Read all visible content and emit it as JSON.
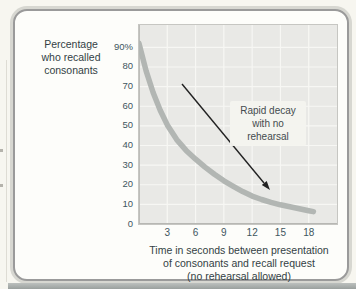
{
  "colors": {
    "page_bg": "#f7f6f0",
    "panel_bg": "#fdfdfa",
    "panel_border": "#9a9a9a",
    "plot_bg": "#e9e9e6",
    "grid_line": "#f7f7f4",
    "curve": "#b2b6b3",
    "arrow": "#222222",
    "text": "#333f44",
    "tick_text": "#3e565e",
    "annotation_bg": "#f5f5f0"
  },
  "labels": {
    "y_axis_lines": [
      "Percentage",
      "who recalled",
      "consonants"
    ],
    "x_axis_lines": [
      "Time in seconds between presentation",
      "of consonants and recall request",
      "(no rehearsal allowed)"
    ],
    "annotation_lines": [
      "Rapid decay",
      "with no",
      "rehearsal"
    ]
  },
  "chart_data": {
    "type": "line",
    "title": "",
    "ylabel": "Percentage who recalled consonants",
    "xlabel": "Time in seconds between presentation of consonants and recall request (no rehearsal allowed)",
    "annotation": "Rapid decay with no rehearsal",
    "grid": true,
    "legend": false,
    "xlim": [
      0,
      21
    ],
    "ylim": [
      0,
      101.4
    ],
    "x_ticks": [
      3,
      6,
      9,
      12,
      15,
      18
    ],
    "x_tick_labels": [
      "3",
      "6",
      "9",
      "12",
      "15",
      "18"
    ],
    "y_ticks": [
      0,
      10,
      20,
      30,
      40,
      50,
      60,
      70,
      80,
      90
    ],
    "y_tick_labels": [
      "0",
      "10",
      "20",
      "30",
      "40",
      "50",
      "60",
      "70",
      "80",
      "90%"
    ],
    "series": [
      {
        "name": "Percent recalling consonants with no rehearsal",
        "x": [
          0,
          0.75,
          1.5,
          2.25,
          3,
          4,
          5,
          6,
          7,
          8,
          9,
          10,
          11,
          12,
          13,
          14,
          15,
          16,
          17,
          18,
          18.5
        ],
        "y": [
          92,
          78,
          67,
          58,
          50.5,
          43,
          37.5,
          33,
          29,
          25.3,
          22,
          19.2,
          16.5,
          14.2,
          12.5,
          11,
          9.8,
          8.8,
          7.8,
          6.8,
          6.3
        ]
      }
    ]
  }
}
